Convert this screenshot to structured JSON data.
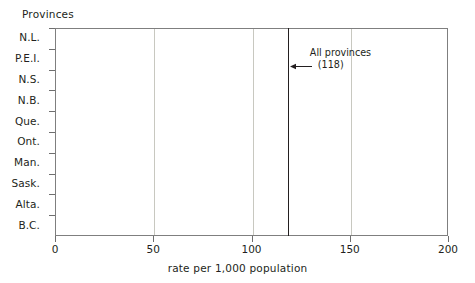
{
  "chart_data": {
    "type": "bar",
    "orientation": "horizontal",
    "title": "",
    "xlabel": "rate per 1,000 population",
    "ylabel": "Provinces",
    "categories": [
      "N.L.",
      "P.E.I.",
      "N.S.",
      "N.B.",
      "Que.",
      "Ont.",
      "Man.",
      "Sask.",
      "Alta.",
      "B.C."
    ],
    "values": [
      96,
      93,
      97,
      120,
      98,
      116,
      175,
      160,
      136,
      136
    ],
    "xlim": [
      0,
      200
    ],
    "xticks": [
      0,
      50,
      100,
      150,
      200
    ],
    "xtick_labels": [
      "0",
      "50",
      "100",
      "150",
      "200"
    ],
    "grid": "vertical",
    "legend": "none",
    "bar_colors": [
      "#bd5520",
      "#2e86bd",
      "#f6b73f",
      "#4f8f3b",
      "#b4b49c",
      "#bd5520",
      "#2e86bd",
      "#f6b73f",
      "#4f8f3b",
      "#b4b49c"
    ],
    "reference_line": {
      "value": 118,
      "label_line1": "All provinces",
      "label_line2": "(118)",
      "color": "#231f20"
    },
    "annotations": [
      {
        "text": "All provinces",
        "value": 118
      },
      {
        "text": "(118)",
        "value": 118
      }
    ]
  },
  "axis": {
    "y_title": "Provinces",
    "x_title": "rate per 1,000 population"
  },
  "colors": {
    "orange": "#bd5520",
    "blue": "#2e86bd",
    "gold": "#f6b73f",
    "green": "#4f8f3b",
    "sage": "#b4b49c",
    "axis": "#7f7f7f",
    "grid": "#c8c8c0",
    "text": "#231f20"
  }
}
